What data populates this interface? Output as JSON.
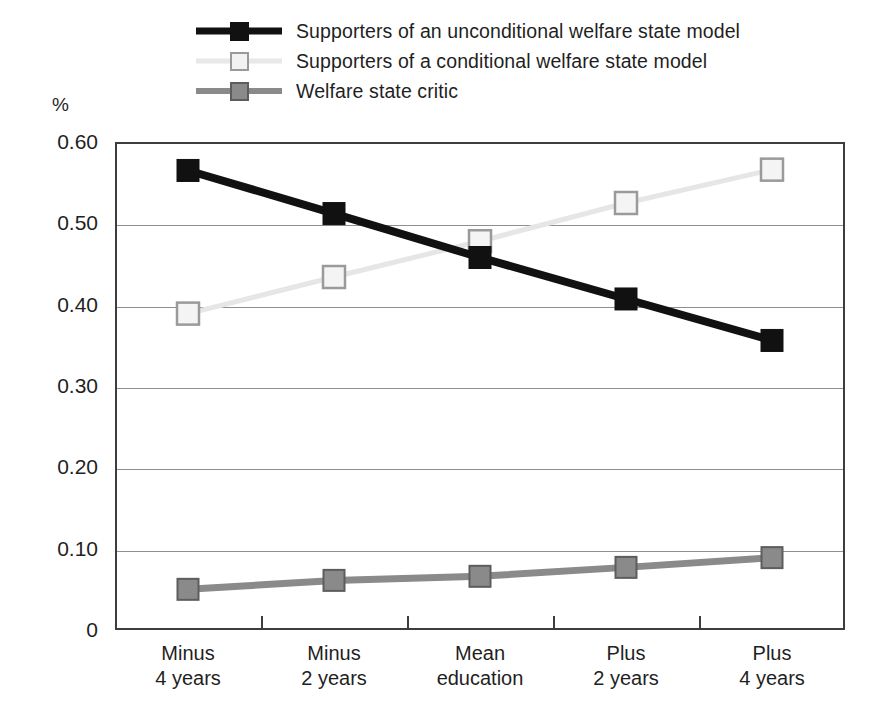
{
  "chart_data": {
    "type": "line",
    "title": "",
    "subtitle": "",
    "xlabel": "",
    "ylabel": "%",
    "ylim": [
      0,
      0.6
    ],
    "yticks": [
      "0",
      "0.10",
      "0.20",
      "0.30",
      "0.40",
      "0.50",
      "0.60"
    ],
    "ytick_values": [
      0,
      0.1,
      0.2,
      0.3,
      0.4,
      0.5,
      0.6
    ],
    "grid": "horizontal",
    "legend_position": "top",
    "categories": [
      "Minus\n4 years",
      "Minus\n2 years",
      "Mean\neducation",
      "Plus\n2 years",
      "Plus\n4 years"
    ],
    "category_lines": [
      [
        "Minus",
        "4 years"
      ],
      [
        "Minus",
        "2 years"
      ],
      [
        "Mean",
        "education"
      ],
      [
        "Plus",
        "2 years"
      ],
      [
        "Plus",
        "4 years"
      ]
    ],
    "series": [
      {
        "name": "Supporters of an unconditional welfare state model",
        "values": [
          0.565,
          0.512,
          0.458,
          0.407,
          0.356
        ],
        "color": "#111111",
        "marker": "filled-square-black"
      },
      {
        "name": "Supporters of a conditional welfare state model",
        "values": [
          0.389,
          0.434,
          0.478,
          0.525,
          0.566
        ],
        "color": "#e8e8e8",
        "marker": "open-square-white"
      },
      {
        "name": "Welfare state critic",
        "values": [
          0.05,
          0.061,
          0.066,
          0.077,
          0.089
        ],
        "color": "#8a8a8a",
        "marker": "filled-square-gray"
      }
    ]
  },
  "legend": {
    "items": [
      {
        "label": "Supporters of an unconditional welfare state model"
      },
      {
        "label": "Supporters of a conditional welfare state model"
      },
      {
        "label": "Welfare state critic"
      }
    ]
  },
  "axes": {
    "y_unit_label": "%"
  }
}
